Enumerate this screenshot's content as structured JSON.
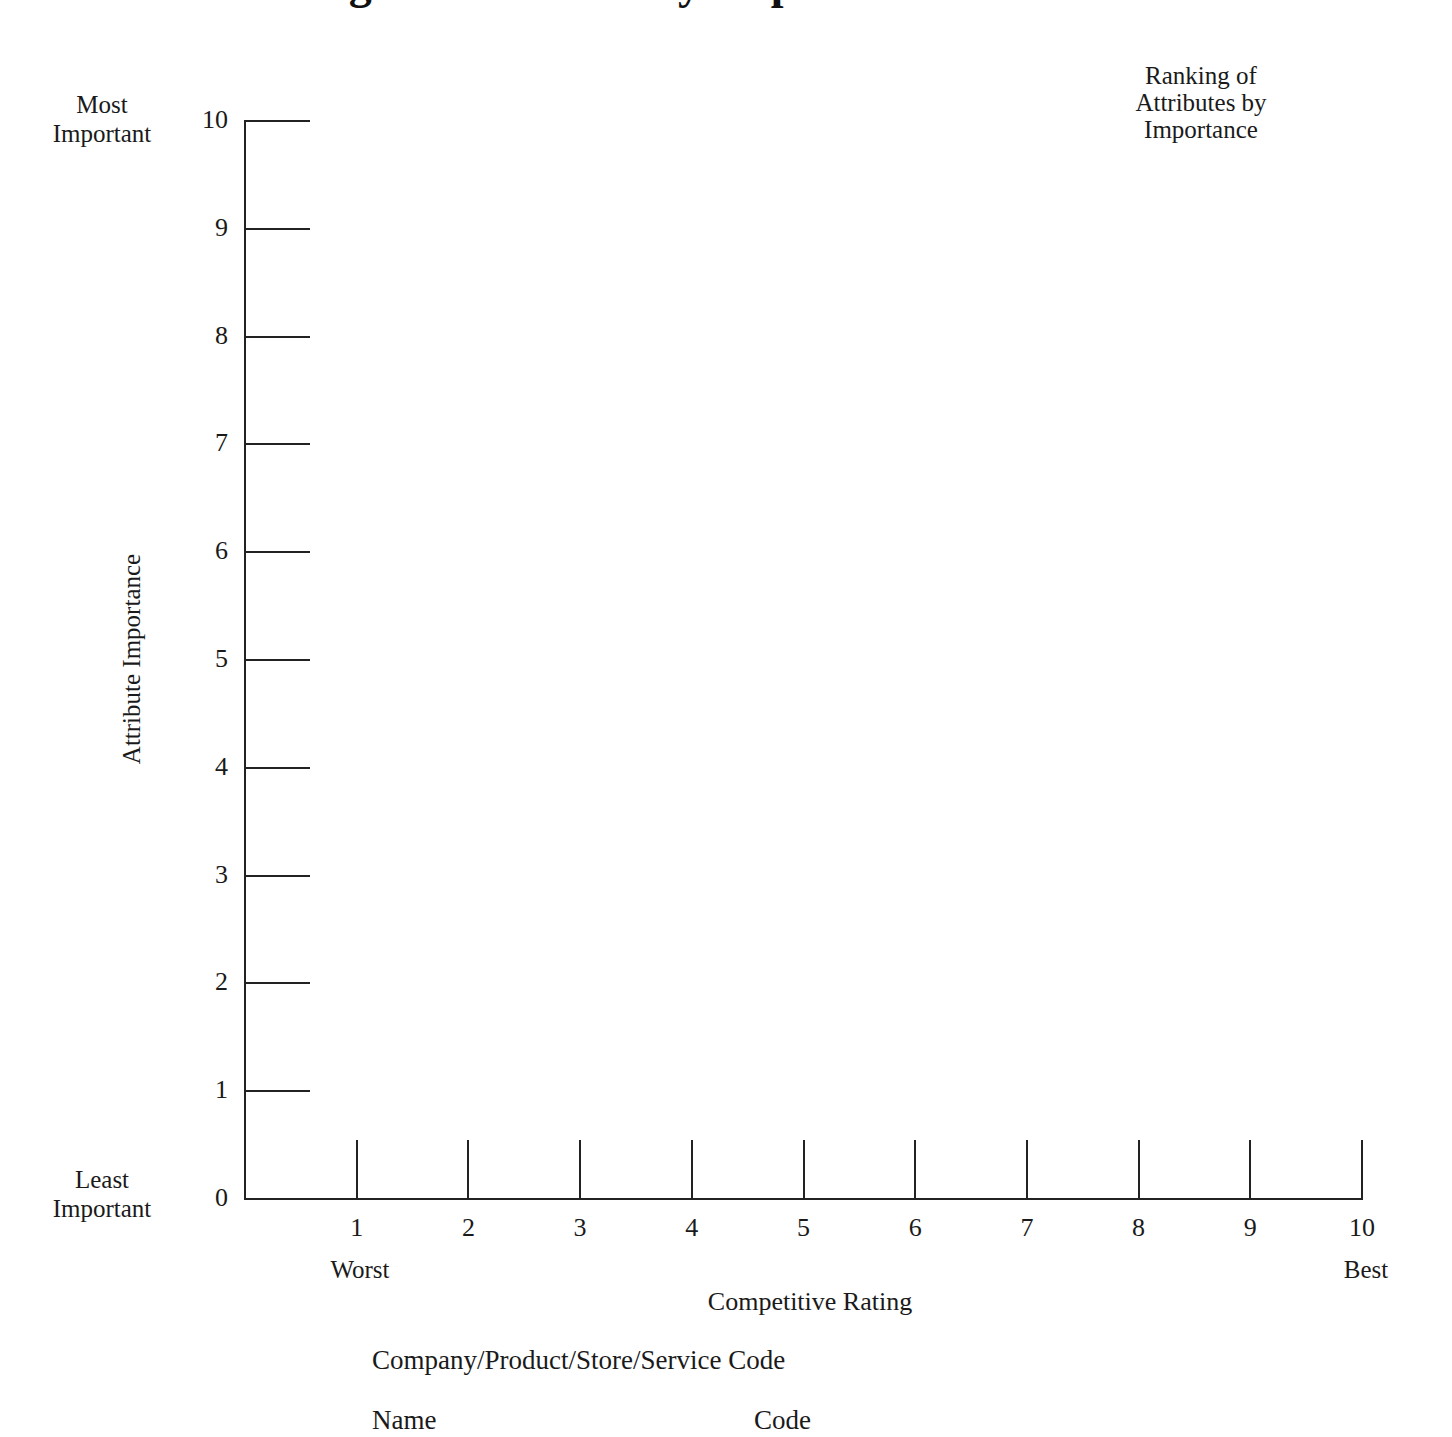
{
  "page": {
    "clipped_title": "Ranking of Attributes by Importance"
  },
  "legend": {
    "title": "Ranking of\nAttributes by\nImportance",
    "line1": "Ranking of",
    "line2": "Attributes by",
    "line3": "Importance"
  },
  "y_axis": {
    "title": "Attribute Importance",
    "top_label_line1": "Most",
    "top_label_line2": "Important",
    "bottom_label_line1": "Least",
    "bottom_label_line2": "Important",
    "ticks": [
      "10",
      "9",
      "8",
      "7",
      "6",
      "5",
      "4",
      "3",
      "2",
      "1",
      "0"
    ],
    "min": 0,
    "max": 10
  },
  "x_axis": {
    "title": "Competitive Rating",
    "left_label": "Worst",
    "right_label": "Best",
    "ticks": [
      "1",
      "2",
      "3",
      "4",
      "5",
      "6",
      "7",
      "8",
      "9",
      "10"
    ],
    "min": 0,
    "max": 10
  },
  "code_section": {
    "title": "Company/Product/Store/Service Code",
    "columns": [
      "Name",
      "Code"
    ],
    "rows": []
  },
  "chart_data": {
    "type": "scatter",
    "title": "Ranking of Attributes by Importance",
    "xlabel": "Competitive Rating",
    "ylabel": "Attribute Importance",
    "xlim": [
      0,
      10
    ],
    "ylim": [
      0,
      10
    ],
    "xticks": [
      1,
      2,
      3,
      4,
      5,
      6,
      7,
      8,
      9,
      10
    ],
    "yticks": [
      0,
      1,
      2,
      3,
      4,
      5,
      6,
      7,
      8,
      9,
      10
    ],
    "x_tick_labels": [
      "1",
      "2",
      "3",
      "4",
      "5",
      "6",
      "7",
      "8",
      "9",
      "10"
    ],
    "y_tick_labels": [
      "0",
      "1",
      "2",
      "3",
      "4",
      "5",
      "6",
      "7",
      "8",
      "9",
      "10"
    ],
    "x_axis_endpoint_labels": [
      "Worst",
      "Best"
    ],
    "y_axis_endpoint_labels": [
      "Least Important",
      "Most Important"
    ],
    "grid": false,
    "legend": "Ranking of Attributes by Importance",
    "legend_position": "top-right",
    "series": [],
    "values": [],
    "note": "Blank worksheet template — no data points plotted"
  },
  "colors": {
    "ink": "#1a1a1a",
    "axis": "#222222",
    "background": "#ffffff"
  }
}
